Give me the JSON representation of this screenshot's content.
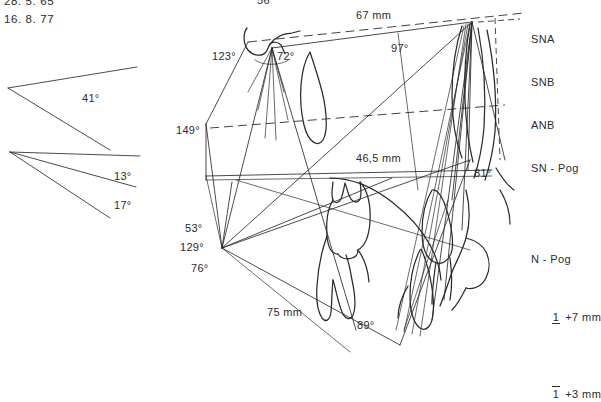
{
  "meta": {
    "ink_color": "#2b2b2b",
    "background_color": "#ffffff"
  },
  "dates": {
    "first": "28. 5. 65",
    "second": "16. 8. 77"
  },
  "angle_diagram": {
    "wedge_label": "41°",
    "fan_labels": [
      "13°",
      "17°"
    ]
  },
  "measurements": {
    "top_clipped": "56°",
    "sn_length": "67 mm",
    "angle_97": "97°",
    "angle_72": "72°",
    "angle_123": "123°",
    "angle_149": "149°",
    "mand_body": "46,5 mm",
    "angle_81": "81°",
    "angle_53": "53°",
    "angle_129": "129°",
    "angle_76": "76°",
    "ramus_length": "75 mm",
    "angle_89": "89°"
  },
  "legend_top": {
    "items": [
      "SNA",
      "SNB",
      "ANB",
      "SN - Pog"
    ]
  },
  "legend_bottom": {
    "header": "N - Pog",
    "rows": [
      {
        "tooth": "1",
        "bar": "under",
        "value": "+7 mm"
      },
      {
        "tooth": "1",
        "bar": "over",
        "value": "+3 mm"
      }
    ]
  }
}
